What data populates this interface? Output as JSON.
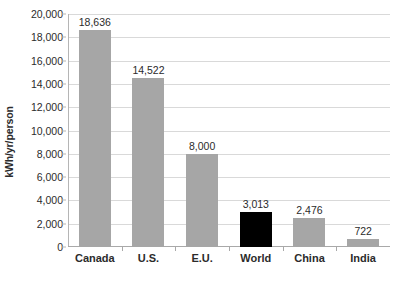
{
  "chart_data": {
    "type": "bar",
    "title": "",
    "xlabel": "",
    "ylabel": "kWh/yr/person",
    "ylim": [
      0,
      20000
    ],
    "grid": true,
    "legend": "none",
    "categories": [
      "Canada",
      "U.S.",
      "E.U.",
      "World",
      "China",
      "India"
    ],
    "values": [
      18636,
      14522,
      8000,
      3013,
      2476,
      722
    ],
    "value_labels": [
      "18,636",
      "14,522",
      "8,000",
      "3,013",
      "2,476",
      "722"
    ],
    "bar_colors": [
      "#a6a6a6",
      "#a6a6a6",
      "#a6a6a6",
      "#000000",
      "#a6a6a6",
      "#a6a6a6"
    ],
    "y_ticks": [
      0,
      2000,
      4000,
      6000,
      8000,
      10000,
      12000,
      14000,
      16000,
      18000,
      20000
    ],
    "y_tick_labels": [
      "0",
      "2,000",
      "4,000",
      "6,000",
      "8,000",
      "10,000",
      "12,000",
      "14,000",
      "16,000",
      "18,000",
      "20,000"
    ],
    "colors": {
      "bar_gray": "#a6a6a6",
      "bar_highlight": "#000000",
      "gridline": "#d9d9d9",
      "axis": "#a9a9a9",
      "text": "#2b2b2b",
      "background": "#ffffff"
    }
  }
}
